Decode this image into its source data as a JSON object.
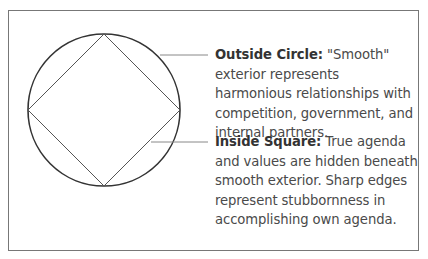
{
  "diagram": {
    "shapes": [
      {
        "name": "outside-circle",
        "cx": 104,
        "cy": 110,
        "r": 76
      },
      {
        "name": "inside-square",
        "points": "104,34 180,110 104,186 28,110"
      }
    ],
    "callouts": [
      {
        "title": "Outside Circle:",
        "text": " \"Smooth\" exterior represents harmonious relationships with competition, government, and internal partners."
      },
      {
        "title": "Inside Square:",
        "text": " True agenda and values are hidden beneath smooth exterior. Sharp edges represent stubbornness in accomplishing own agenda."
      }
    ],
    "colors": {
      "circle": "#333333",
      "square": "#555555",
      "leader": "#888888",
      "frame": "#777777"
    }
  }
}
